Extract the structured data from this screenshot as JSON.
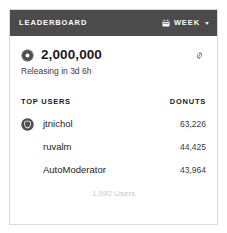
{
  "card": {
    "header": {
      "title": "LEADERBOARD",
      "period_label": "WEEK",
      "calendar_icon": "calendar-icon",
      "chevron_icon": "chevron-down-icon",
      "background_color": "#4b4b4b",
      "text_color": "#ffffff"
    },
    "counter": {
      "donut_icon": "donut-icon",
      "value": "2,000,000",
      "subtitle": "Releasing in 3d 6h",
      "settings_icon": "gear-icon"
    },
    "table": {
      "columns": [
        "TOP USERS",
        "DONUTS"
      ],
      "rows": [
        {
          "avatar_icon": "shield-avatar-icon",
          "has_avatar": true,
          "name": "jtnichol",
          "donuts": "63,226"
        },
        {
          "avatar_icon": "",
          "has_avatar": false,
          "name": "ruvalm",
          "donuts": "44,425"
        },
        {
          "avatar_icon": "",
          "has_avatar": false,
          "name": "AutoModerator",
          "donuts": "43,964"
        }
      ]
    },
    "footer": {
      "total_users": "1,992 Users"
    },
    "border_color": "#d8dada",
    "background_color": "#ffffff"
  }
}
